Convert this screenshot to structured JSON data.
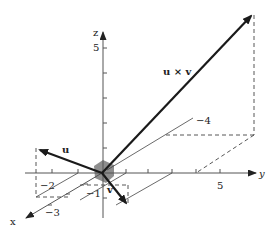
{
  "figure": {
    "axes": {
      "x_label": "x",
      "y_label": "y",
      "z_label": "z"
    },
    "tick_labels": {
      "z_5": "5",
      "y_neg2": "−2",
      "y_5": "5",
      "x_neg1": "−1",
      "x_neg3": "−3",
      "x_neg4": "−4"
    },
    "vectors": {
      "u": "u",
      "v": "v",
      "cross": "u × v"
    },
    "colors": {
      "vector": "#1a1a1a",
      "axis": "#555555",
      "parallelogram": "#7a7a7a"
    }
  }
}
